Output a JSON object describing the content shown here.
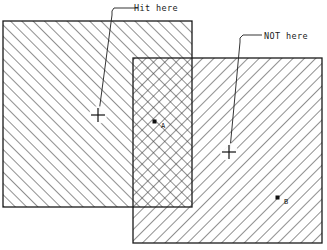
{
  "diagram": {
    "background_color": "#ffffff",
    "stroke_color": "#1a1a1a",
    "hatch_color": "#3a3a3a",
    "annotations": [
      {
        "id": "hit-here",
        "text": "Hit here",
        "text_x": 134,
        "text_y": 11,
        "leader": "M 138 8 L 114 8 L 112 11 L 112 15 L 99 112",
        "marker_x": 98,
        "marker_y": 115,
        "marker_kind": "crosshair"
      },
      {
        "id": "not-here",
        "text": "NOT here",
        "text_x": 264,
        "text_y": 39,
        "leader": "M 262 35 L 243 35 L 240 38 L 240 42 L 230 149",
        "marker_x": 229,
        "marker_y": 152,
        "marker_kind": "crosshair"
      }
    ],
    "rectangles": [
      {
        "id": "left-rect",
        "x": 3,
        "y": 21,
        "width": 189,
        "height": 186,
        "hatch": "up"
      },
      {
        "id": "right-rect",
        "x": 133,
        "y": 58,
        "width": 189,
        "height": 185,
        "hatch": "down"
      }
    ],
    "overlap_region": {
      "id": "overlap-rect",
      "x": 133,
      "y": 58,
      "width": 59,
      "height": 149,
      "hatch": "cross"
    },
    "points": [
      {
        "id": "point-a",
        "label": "A",
        "x": 155,
        "y": 122,
        "label_x": 161,
        "label_y": 128
      },
      {
        "id": "point-b",
        "label": "B",
        "x": 278,
        "y": 198,
        "label_x": 284,
        "label_y": 204
      }
    ]
  }
}
